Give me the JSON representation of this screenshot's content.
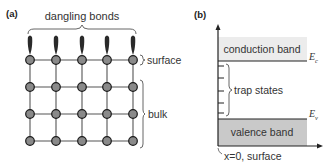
{
  "panel_a": {
    "label": "(a)",
    "title": "dangling bonds",
    "surface_label": "surface",
    "bulk_label": "bulk",
    "lattice": {
      "columns": [
        30,
        56,
        82,
        107,
        133
      ],
      "rows": [
        60,
        87,
        114,
        141
      ],
      "node_fill": "#8a8a8a",
      "node_stroke": "#1a1a1a",
      "bond_color": "#2a2a2a"
    }
  },
  "panel_b": {
    "label": "(b)",
    "conduction_band_label": "conduction band",
    "valence_band_label": "valence band",
    "trap_states_label": "trap states",
    "ec_label": "E",
    "ec_subscript": "c",
    "ev_label": "E",
    "ev_subscript": "v",
    "x_axis_label": "x=0, surface",
    "conduction_fill": "#ececec",
    "valence_fill": "#c9c9c9",
    "trap_ticks_y": [
      64,
      77,
      90,
      103,
      114
    ]
  }
}
